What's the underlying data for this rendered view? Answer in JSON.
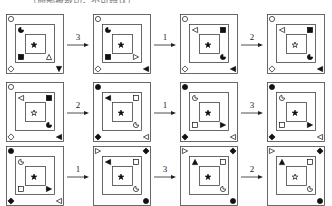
{
  "top_text": "……（局部被裁切，不可辨认）……",
  "rows": [
    {
      "panels": [
        {
          "id": "r1p1",
          "symbols": {
            "outer_tl": "circle-open",
            "outer_bl": "diamond-open",
            "outer_br": "triangle-down-filled",
            "mid_tl": "pacman-filled",
            "mid_bl": "square-filled",
            "mid_br": "triangle-up-open",
            "inner": "star-filled"
          }
        },
        {
          "id": "r1p2",
          "symbols": {
            "outer_tl": "circle-open",
            "outer_bl": "diamond-open",
            "outer_br": "triangle-left-filled",
            "mid_tl": "pacman-filled",
            "mid_bl": "square-filled",
            "mid_br": "triangle-right-open",
            "inner": "star-filled"
          }
        },
        {
          "id": "r1p3",
          "symbols": {
            "outer_tl": "circle-open",
            "outer_bl": "diamond-open",
            "outer_br": "triangle-left-filled",
            "mid_tl": "triangle-left-open",
            "mid_tr": "square-filled",
            "mid_br": "pacman-filled",
            "inner": "star-filled"
          }
        },
        {
          "id": "r1p4",
          "symbols": {
            "outer_tl": "circle-open",
            "outer_bl": "diamond-open",
            "outer_br": "triangle-left-filled",
            "mid_tl": "triangle-left-open",
            "mid_tr": "square-filled",
            "mid_br": "pacman-filled",
            "inner": "star-open"
          }
        }
      ],
      "arrows": [
        "3",
        "1",
        "2"
      ]
    },
    {
      "panels": [
        {
          "id": "r2p1",
          "symbols": {
            "outer_tl": "circle-open",
            "outer_bl": "diamond-open",
            "outer_br": "triangle-left-filled",
            "mid_tl": "triangle-left-open",
            "mid_tr": "square-filled",
            "mid_br": "pacman-filled",
            "inner": "star-open"
          }
        },
        {
          "id": "r2p2",
          "symbols": {
            "outer_tl": "circle-filled",
            "outer_bl": "diamond-filled",
            "outer_br": "triangle-left-open",
            "mid_tl": "triangle-left-filled",
            "mid_tr": "square-open",
            "mid_br": "pacman-open",
            "inner": "star-filled"
          }
        },
        {
          "id": "r2p3",
          "symbols": {
            "outer_tl": "circle-filled",
            "outer_bl": "diamond-filled",
            "outer_br": "triangle-left-open",
            "mid_tl": "pacman-open",
            "mid_bl": "square-open",
            "mid_br": "triangle-right-filled",
            "inner": "star-filled"
          }
        },
        {
          "id": "r2p4",
          "symbols": {
            "outer_tl": "circle-filled",
            "outer_bl": "diamond-filled",
            "outer_br": "triangle-left-open",
            "mid_tl": "pacman-open",
            "mid_bl": "square-open",
            "mid_br": "triangle-right-filled",
            "inner": "star-filled"
          }
        }
      ],
      "arrows": [
        "2",
        "1",
        "3"
      ]
    },
    {
      "panels": [
        {
          "id": "r3p1",
          "symbols": {
            "outer_tl": "circle-filled",
            "outer_bl": "diamond-filled",
            "outer_br": "triangle-left-open",
            "mid_tl": "pacman-open",
            "mid_bl": "square-open",
            "mid_br": "triangle-right-filled",
            "inner": "star-filled"
          }
        },
        {
          "id": "r3p2",
          "symbols": {
            "outer_tl": "triangle-right-open",
            "outer_tr": "diamond-filled",
            "outer_br": "circle-filled",
            "mid_tl": "triangle-left-filled",
            "mid_tr": "square-open",
            "mid_br": "pacman-open",
            "inner": "star-filled"
          }
        },
        {
          "id": "r3p3",
          "symbols": {
            "outer_tl": "triangle-right-open",
            "outer_tr": "diamond-filled",
            "outer_br": "circle-filled",
            "mid_tl": "triangle-up-filled",
            "mid_tr": "square-open",
            "mid_br": "pacman-open",
            "inner": "star-filled"
          }
        },
        {
          "id": "r3p4",
          "symbols": {
            "outer_tl": "triangle-right-open",
            "outer_tr": "diamond-filled",
            "outer_br": "circle-filled",
            "mid_tl": "triangle-up-filled",
            "mid_tr": "square-open",
            "mid_br": "pacman-open",
            "inner": "star-open"
          }
        }
      ],
      "arrows": [
        "1",
        "3",
        "2"
      ]
    }
  ],
  "layout": {
    "col_x": [
      6,
      93,
      180,
      267
    ],
    "row_y": [
      14,
      82,
      146
    ],
    "arrow_x": [
      65,
      152,
      239
    ]
  }
}
